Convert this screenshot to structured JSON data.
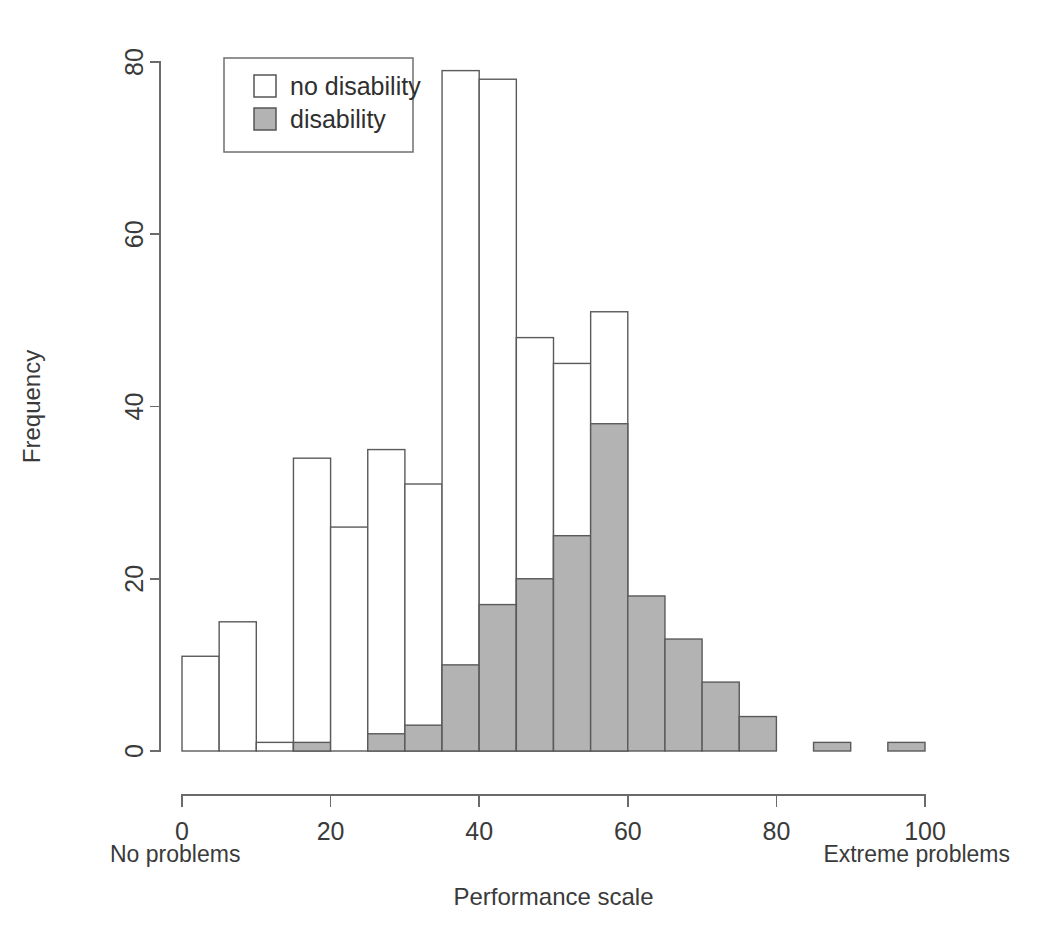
{
  "chart_data": {
    "type": "bar",
    "title": "",
    "subtitle": "",
    "xlabel": "Performance scale",
    "ylabel": "Frequency",
    "xlim": [
      0,
      100
    ],
    "ylim": [
      0,
      80
    ],
    "grid": false,
    "bin_width": 5,
    "stacked": true,
    "legend_position": "top-left",
    "x_tick_labels": [
      "0",
      "20",
      "40",
      "60",
      "80",
      "100"
    ],
    "x_ticks": [
      0,
      20,
      40,
      60,
      80,
      100
    ],
    "y_tick_labels": [
      "0",
      "20",
      "40",
      "60",
      "80"
    ],
    "y_ticks": [
      0,
      20,
      40,
      60,
      80
    ],
    "axis_endpoint_labels": {
      "left": "No problems",
      "right": "Extreme problems"
    },
    "legend": {
      "entries": [
        {
          "label": "no disability",
          "swatch": "open",
          "color": "#ffffff"
        },
        {
          "label": "disability",
          "swatch": "filled",
          "color": "#b3b3b3"
        }
      ]
    },
    "bins": [
      {
        "x0": 0,
        "x1": 5,
        "total": 11,
        "disability": 0,
        "no_disability": 11
      },
      {
        "x0": 5,
        "x1": 10,
        "total": 15,
        "disability": 0,
        "no_disability": 15
      },
      {
        "x0": 10,
        "x1": 15,
        "total": 1,
        "disability": 0,
        "no_disability": 1
      },
      {
        "x0": 15,
        "x1": 20,
        "total": 34,
        "disability": 1,
        "no_disability": 33
      },
      {
        "x0": 20,
        "x1": 25,
        "total": 26,
        "disability": 0,
        "no_disability": 26
      },
      {
        "x0": 25,
        "x1": 30,
        "total": 35,
        "disability": 2,
        "no_disability": 33
      },
      {
        "x0": 30,
        "x1": 35,
        "total": 31,
        "disability": 3,
        "no_disability": 28
      },
      {
        "x0": 35,
        "x1": 40,
        "total": 79,
        "disability": 10,
        "no_disability": 69
      },
      {
        "x0": 40,
        "x1": 45,
        "total": 78,
        "disability": 17,
        "no_disability": 61
      },
      {
        "x0": 45,
        "x1": 50,
        "total": 48,
        "disability": 20,
        "no_disability": 28
      },
      {
        "x0": 50,
        "x1": 55,
        "total": 45,
        "disability": 25,
        "no_disability": 20
      },
      {
        "x0": 55,
        "x1": 60,
        "total": 51,
        "disability": 38,
        "no_disability": 13
      },
      {
        "x0": 60,
        "x1": 65,
        "total": 18,
        "disability": 18,
        "no_disability": 0
      },
      {
        "x0": 65,
        "x1": 70,
        "total": 13,
        "disability": 13,
        "no_disability": 0
      },
      {
        "x0": 70,
        "x1": 75,
        "total": 8,
        "disability": 8,
        "no_disability": 0
      },
      {
        "x0": 75,
        "x1": 80,
        "total": 4,
        "disability": 4,
        "no_disability": 0
      },
      {
        "x0": 80,
        "x1": 85,
        "total": 0,
        "disability": 0,
        "no_disability": 0
      },
      {
        "x0": 85,
        "x1": 90,
        "total": 1,
        "disability": 1,
        "no_disability": 0
      },
      {
        "x0": 90,
        "x1": 95,
        "total": 0,
        "disability": 0,
        "no_disability": 0
      },
      {
        "x0": 95,
        "x1": 100,
        "total": 1,
        "disability": 1,
        "no_disability": 0
      }
    ],
    "series": [
      {
        "name": "no disability",
        "values": [
          11,
          15,
          1,
          33,
          26,
          33,
          28,
          69,
          61,
          28,
          20,
          13,
          0,
          0,
          0,
          0,
          0,
          0,
          0,
          0
        ]
      },
      {
        "name": "disability",
        "values": [
          0,
          0,
          0,
          1,
          0,
          2,
          3,
          10,
          17,
          20,
          25,
          38,
          18,
          13,
          8,
          4,
          0,
          1,
          0,
          1
        ]
      }
    ],
    "categories": [
      "0-5",
      "5-10",
      "10-15",
      "15-20",
      "20-25",
      "25-30",
      "30-35",
      "35-40",
      "40-45",
      "45-50",
      "50-55",
      "55-60",
      "60-65",
      "65-70",
      "70-75",
      "75-80",
      "80-85",
      "85-90",
      "90-95",
      "95-100"
    ],
    "colors": {
      "bar_fill_disability": "#b3b3b3",
      "bar_fill_no_disability": "#ffffff",
      "bar_stroke": "#5a5a5a",
      "axis": "#6b6b6b",
      "text": "#3a3a3a"
    }
  }
}
